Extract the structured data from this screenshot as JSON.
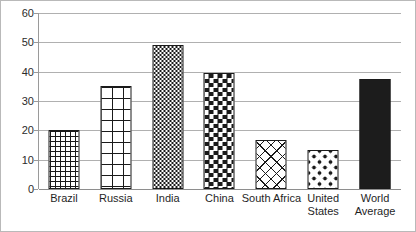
{
  "chart_data": {
    "type": "bar",
    "title": "",
    "subtitle": "",
    "xlabel": "",
    "ylabel": "",
    "ylim": [
      0,
      60
    ],
    "yticks": [
      0,
      10,
      20,
      30,
      40,
      50,
      60
    ],
    "ytick_labels": [
      "0",
      "10",
      "20",
      "30",
      "40",
      "50",
      "60"
    ],
    "grid": true,
    "legend": "none",
    "categories": [
      "Brazil",
      "Russia",
      "India",
      "China",
      "South Africa",
      "United States",
      "World Average"
    ],
    "category_lines": [
      [
        "Brazil"
      ],
      [
        "Russia"
      ],
      [
        "India"
      ],
      [
        "China"
      ],
      [
        "South Africa"
      ],
      [
        "United",
        "States"
      ],
      [
        "World",
        "Average"
      ]
    ],
    "values": [
      20,
      35,
      49,
      39.5,
      16.7,
      13.3,
      37.5
    ],
    "bar_patterns": [
      "grid-fine",
      "grid-coarse",
      "checkerboard-fine",
      "checkerboard-medium",
      "diagonal-crosshatch",
      "dots",
      "solid"
    ],
    "colors": {
      "fill": "#1a1a1a",
      "background": "#ffffff",
      "gridline": "#b0b0b0",
      "axis": "#8e8e8e",
      "text": "#1f1f1f",
      "frame": "#b9b9b9"
    }
  }
}
